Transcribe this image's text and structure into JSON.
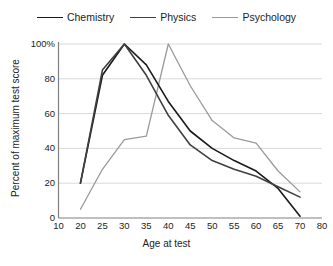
{
  "chart_data": {
    "type": "line",
    "title": "",
    "xlabel": "Age at test",
    "ylabel": "Percent of maximum test score",
    "x": [
      10,
      20,
      25,
      30,
      35,
      40,
      45,
      50,
      55,
      60,
      65,
      70,
      80
    ],
    "xtick_labels": [
      "10",
      "20",
      "25",
      "30",
      "35",
      "40",
      "45",
      "50",
      "55",
      "60",
      "65",
      "70",
      "80"
    ],
    "ytick_labels": [
      "0",
      "20",
      "40",
      "60",
      "80",
      "100%"
    ],
    "ytick_values": [
      0,
      20,
      40,
      60,
      80,
      100
    ],
    "ylim": [
      0,
      100
    ],
    "grid": "horizontal",
    "legend_position": "top-center",
    "series": [
      {
        "name": "Chemistry",
        "color": "#1a1a1a",
        "width": 1.6,
        "x": [
          20,
          25,
          30,
          35,
          40,
          45,
          50,
          55,
          60,
          65,
          70
        ],
        "values": [
          20,
          82,
          100,
          88,
          67,
          50,
          40,
          33,
          27,
          17,
          1
        ]
      },
      {
        "name": "Physics",
        "color": "#404040",
        "width": 1.6,
        "x": [
          20,
          25,
          30,
          35,
          40,
          45,
          50,
          55,
          60,
          65,
          70
        ],
        "values": [
          20,
          85,
          100,
          82,
          59,
          42,
          33,
          28,
          24,
          18,
          12
        ]
      },
      {
        "name": "Psychology",
        "color": "#9a9a9a",
        "width": 1.3,
        "x": [
          20,
          25,
          30,
          35,
          40,
          45,
          50,
          55,
          60,
          65,
          70
        ],
        "values": [
          5,
          28,
          45,
          47,
          100,
          76,
          56,
          46,
          43,
          27,
          15
        ]
      }
    ],
    "axis_color": "#808080",
    "grid_color": "#d9d9d9"
  },
  "legend": {
    "entries": [
      {
        "label": "Chemistry"
      },
      {
        "label": "Physics"
      },
      {
        "label": "Psychology"
      }
    ]
  }
}
